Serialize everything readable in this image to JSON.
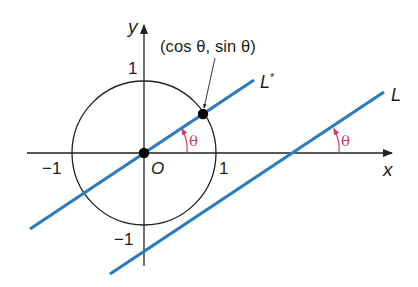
{
  "figure": {
    "colors": {
      "axes": "#231f20",
      "circle": "#231f20",
      "lines": "#2b7bc2",
      "angle_marks": "#c8406a",
      "points": "#000000",
      "background": "#ffffff"
    },
    "axes": {
      "x_label": "x",
      "y_label": "y",
      "origin_label": "O",
      "ticks": {
        "x_pos": "1",
        "x_neg": "−1",
        "y_pos": "1",
        "y_neg": "−1"
      }
    },
    "circle": {
      "type": "unit circle",
      "center": "O",
      "radius": 1
    },
    "lines": [
      {
        "name": "L*",
        "label": "L*",
        "passes_through": "O",
        "angle": "θ"
      },
      {
        "name": "L",
        "label": "L",
        "angle": "θ"
      }
    ],
    "points": [
      {
        "label": "(cos θ, sin θ)",
        "on": "unit circle and L*"
      },
      {
        "label": "O",
        "at": "origin"
      }
    ],
    "angle_labels": [
      "θ",
      "θ"
    ],
    "text": {
      "point_label": "(cos θ, sin θ)",
      "line_star_label": "L",
      "line_star_sup": "*",
      "line_label": "L",
      "theta": "θ"
    }
  }
}
